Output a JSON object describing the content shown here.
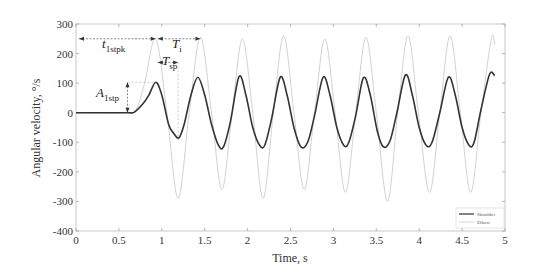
{
  "chart_data": {
    "type": "line",
    "title": "",
    "xlabel": "Time, s",
    "ylabel": "Angular velocity,  °/s",
    "xlim": [
      0,
      5
    ],
    "ylim": [
      -400,
      300
    ],
    "xticks": [
      0,
      0.5,
      1,
      1.5,
      2,
      2.5,
      3,
      3.5,
      4,
      4.5,
      5
    ],
    "xtick_labels": [
      "0",
      "0.5",
      "1",
      "1.5",
      "2",
      "2.5",
      "3",
      "3.5",
      "4",
      "4.5",
      "5"
    ],
    "yticks": [
      300,
      200,
      100,
      0,
      -100,
      -200,
      -300,
      -400
    ],
    "ytick_labels": [
      "300",
      "200",
      "100",
      "0",
      "-100",
      "-200",
      "-300",
      "-400"
    ],
    "grid": false,
    "legend_position": "lower right",
    "series": [
      {
        "name": "Shoulder",
        "style": "solid dark",
        "color": "#333333",
        "x": [
          0,
          0.3,
          0.6,
          0.68,
          0.78,
          0.85,
          0.93,
          1.0,
          1.08,
          1.14,
          1.2,
          1.26,
          1.34,
          1.42,
          1.5,
          1.58,
          1.66,
          1.72,
          1.8,
          1.9,
          1.98,
          2.06,
          2.14,
          2.2,
          2.28,
          2.38,
          2.46,
          2.54,
          2.62,
          2.7,
          2.78,
          2.88,
          2.96,
          3.04,
          3.12,
          3.18,
          3.26,
          3.35,
          3.43,
          3.51,
          3.58,
          3.66,
          3.74,
          3.84,
          3.92,
          4.0,
          4.08,
          4.15,
          4.24,
          4.34,
          4.42,
          4.5,
          4.58,
          4.64,
          4.72,
          4.82,
          4.88
        ],
        "y": [
          0,
          0,
          0,
          2,
          30,
          60,
          103,
          60,
          -40,
          -70,
          -85,
          -40,
          60,
          120,
          60,
          -40,
          -110,
          -115,
          -30,
          122,
          60,
          -50,
          -110,
          -110,
          -20,
          120,
          60,
          -50,
          -115,
          -100,
          -10,
          120,
          60,
          -50,
          -110,
          -100,
          -10,
          118,
          60,
          -60,
          -115,
          -95,
          0,
          128,
          60,
          -50,
          -110,
          -100,
          0,
          120,
          60,
          -50,
          -110,
          -100,
          10,
          130,
          125
        ]
      },
      {
        "name": "Elbow",
        "style": "solid light",
        "color": "#cccccc",
        "x": [
          0,
          0.6,
          0.7,
          0.8,
          0.93,
          1.06,
          1.19,
          1.32,
          1.45,
          1.58,
          1.7,
          1.82,
          1.94,
          2.06,
          2.18,
          2.3,
          2.42,
          2.54,
          2.66,
          2.78,
          2.9,
          3.02,
          3.14,
          3.26,
          3.38,
          3.5,
          3.63,
          3.75,
          3.87,
          3.99,
          4.12,
          4.24,
          4.36,
          4.48,
          4.6,
          4.72,
          4.84,
          4.88
        ],
        "y": [
          0,
          0,
          10,
          100,
          250,
          0,
          -290,
          0,
          255,
          0,
          -260,
          0,
          250,
          0,
          -290,
          0,
          260,
          0,
          -260,
          0,
          250,
          0,
          -270,
          0,
          255,
          0,
          -300,
          0,
          260,
          0,
          -270,
          0,
          260,
          0,
          -270,
          0,
          250,
          230
        ]
      }
    ],
    "annotations": [
      {
        "label": "t",
        "sub": "1stpk",
        "desc": "time to first peak",
        "from_t": 0,
        "to_t": 0.93,
        "y": 250
      },
      {
        "label": "T",
        "sub": "i",
        "desc": "period",
        "from_t": 0.93,
        "to_t": 1.45,
        "y": 250
      },
      {
        "label": "T",
        "sub": "sp",
        "desc": "sub period",
        "from_t": 0.93,
        "to_t": 1.19,
        "y": 170
      },
      {
        "label": "A",
        "sub": "1stp",
        "desc": "first peak amplitude",
        "t": 0.6,
        "from_y": 0,
        "to_y": 103
      }
    ]
  }
}
